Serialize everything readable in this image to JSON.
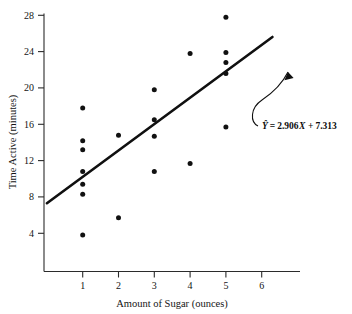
{
  "chart_data": {
    "type": "scatter",
    "title": "",
    "xlabel": "Amount of Sugar (ounces)",
    "ylabel": "Time Active (minutes)",
    "xlim": [
      0,
      6.6
    ],
    "ylim": [
      0,
      28.9
    ],
    "xticks": [
      1,
      2,
      3,
      4,
      5,
      6
    ],
    "yticks": [
      4,
      8,
      12,
      16,
      20,
      24,
      28
    ],
    "xtick_labels": [
      "1",
      "2",
      "3",
      "4",
      "5",
      "6"
    ],
    "ytick_labels": [
      "4",
      "8",
      "12",
      "16",
      "20",
      "24",
      "28"
    ],
    "grid": false,
    "legend": "none",
    "points": [
      {
        "x": 1,
        "y": 17.8
      },
      {
        "x": 1,
        "y": 14.2
      },
      {
        "x": 1,
        "y": 13.2
      },
      {
        "x": 1,
        "y": 10.8
      },
      {
        "x": 1,
        "y": 9.4
      },
      {
        "x": 1,
        "y": 8.3
      },
      {
        "x": 1,
        "y": 3.8
      },
      {
        "x": 2,
        "y": 14.8
      },
      {
        "x": 2,
        "y": 5.7
      },
      {
        "x": 3,
        "y": 19.8
      },
      {
        "x": 3,
        "y": 16.5
      },
      {
        "x": 3,
        "y": 14.7
      },
      {
        "x": 3,
        "y": 10.8
      },
      {
        "x": 4,
        "y": 23.8
      },
      {
        "x": 4,
        "y": 11.7
      },
      {
        "x": 5,
        "y": 27.8
      },
      {
        "x": 5,
        "y": 23.9
      },
      {
        "x": 5,
        "y": 22.8
      },
      {
        "x": 5,
        "y": 21.6
      },
      {
        "x": 5,
        "y": 15.7
      }
    ],
    "regression": {
      "slope": 2.906,
      "intercept": 7.313,
      "x_start": 0.0,
      "x_end": 6.3,
      "annotation": "Ŷ = 2.906X + 7.313"
    },
    "annotation": {
      "equation_yhat": "Ŷ",
      "equation_equals": "=",
      "equation_slope": "2.906",
      "equation_xvar": "X",
      "equation_plus": "+",
      "equation_intercept": "7.313",
      "full_text": "Ŷ = 2.906X + 7.313"
    }
  }
}
